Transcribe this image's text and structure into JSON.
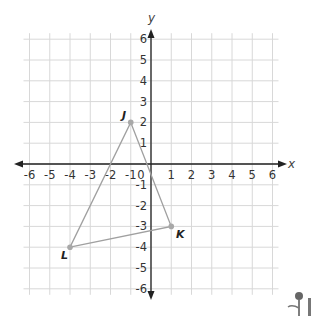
{
  "chart_data": {
    "type": "scatter",
    "title": "",
    "xlabel": "x",
    "ylabel": "y",
    "xlim": [
      -6,
      6
    ],
    "ylim": [
      -6,
      6
    ],
    "grid": true,
    "x_ticks": [
      "-6",
      "-5",
      "-4",
      "-3",
      "-2",
      "-1",
      "0",
      "1",
      "2",
      "3",
      "4",
      "5",
      "6"
    ],
    "y_ticks": [
      "6",
      "5",
      "4",
      "3",
      "2",
      "1",
      "-1",
      "-2",
      "-3",
      "-4",
      "-5",
      "-6"
    ],
    "points": [
      {
        "label": "J",
        "x": -1,
        "y": 2
      },
      {
        "label": "K",
        "x": 1,
        "y": -3
      },
      {
        "label": "L",
        "x": -4,
        "y": -4
      }
    ],
    "shape": "triangle JKL"
  },
  "axes": {
    "x_label": "x",
    "y_label": "y",
    "origin_label": "0"
  },
  "vertices": {
    "J": "J",
    "K": "K",
    "L": "L"
  },
  "colors": {
    "grid": "#d8d8d8",
    "axis": "#222222",
    "triangle": "#a0a0a0",
    "point": "#a8a8a8"
  }
}
